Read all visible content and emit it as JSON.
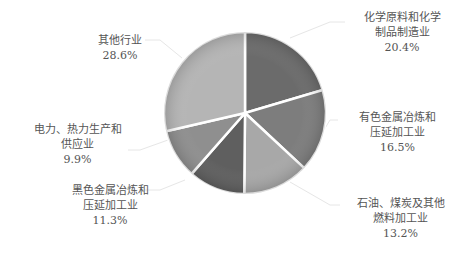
{
  "chart_data": {
    "type": "pie",
    "title": "",
    "categories": [
      "化学原料和化学制品制造业",
      "有色金属冶炼和压延加工业",
      "石油、煤炭及其他燃料加工业",
      "黑色金属冶炼和压延加工业",
      "电力、热力生产和供应业",
      "其他行业"
    ],
    "values": [
      20.4,
      16.5,
      13.2,
      11.3,
      9.9,
      28.6
    ],
    "unit": "%",
    "legend": "none",
    "labels": [
      {
        "line1": "化学原料和化学",
        "line2": "制品制造业",
        "value": "20.4%"
      },
      {
        "line1": "有色金属冶炼和",
        "line2": "压延加工业",
        "value": "16.5%"
      },
      {
        "line1": "石油、煤炭及其他",
        "line2": "燃料加工业",
        "value": "13.2%"
      },
      {
        "line1": "黑色金属冶炼和",
        "line2": "压延加工业",
        "value": "11.3%"
      },
      {
        "line1": "电力、热力生产和",
        "line2": "供应业",
        "value": "9.9%"
      },
      {
        "line1": "其他行业",
        "line2": "",
        "value": "28.6%"
      }
    ],
    "colors": [
      "#6b6b6b",
      "#7d7d7d",
      "#a8a8a8",
      "#5f5f5f",
      "#8f8f8f",
      "#b5b5b5"
    ]
  }
}
